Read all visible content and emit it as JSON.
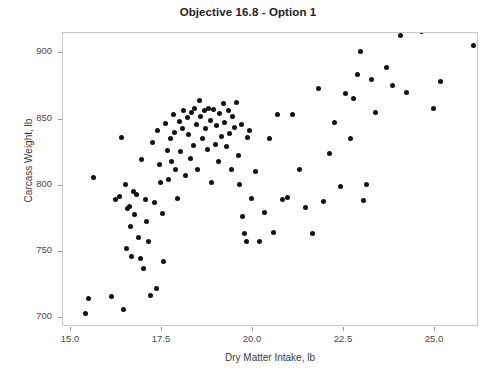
{
  "chart_data": {
    "type": "scatter",
    "title": "Objective 16.8 - Option 1",
    "xlabel": "Dry Matter Intake, lb",
    "ylabel": "Carcass Weight, lb",
    "xlim": [
      14.78,
      26.21
    ],
    "ylim": [
      693.0,
      915.5
    ],
    "xticks": [
      15.0,
      17.5,
      20.0,
      22.5,
      25.0
    ],
    "xticklabels": [
      "15.0",
      "17.5",
      "20.0",
      "22.5",
      "25.0"
    ],
    "yticks": [
      700,
      750,
      800,
      850,
      900
    ],
    "yticklabels": [
      "700",
      "750",
      "800",
      "850",
      "900"
    ],
    "grid": false,
    "legend": null,
    "marker": "filled-circle",
    "marker_color": "#121212",
    "marker_size_px": 5,
    "n_points": 122,
    "series": [
      {
        "name": "observations",
        "points": [
          [
            15.41,
            703.5
          ],
          [
            15.49,
            714.5
          ],
          [
            15.61,
            806.5
          ],
          [
            16.12,
            716.0
          ],
          [
            16.21,
            789.5
          ],
          [
            16.32,
            791.5
          ],
          [
            16.38,
            836.5
          ],
          [
            16.44,
            706.5
          ],
          [
            16.49,
            800.5
          ],
          [
            16.52,
            752.5
          ],
          [
            16.55,
            782.5
          ],
          [
            16.6,
            784.0
          ],
          [
            16.63,
            769.0
          ],
          [
            16.66,
            746.5
          ],
          [
            16.71,
            795.5
          ],
          [
            16.74,
            778.0
          ],
          [
            16.79,
            793.0
          ],
          [
            16.85,
            760.5
          ],
          [
            16.91,
            744.5
          ],
          [
            16.94,
            819.5
          ],
          [
            17.0,
            737.5
          ],
          [
            17.05,
            789.5
          ],
          [
            17.08,
            772.5
          ],
          [
            17.13,
            757.5
          ],
          [
            17.19,
            716.5
          ],
          [
            17.25,
            832.5
          ],
          [
            17.3,
            787.0
          ],
          [
            17.34,
            722.0
          ],
          [
            17.38,
            841.5
          ],
          [
            17.42,
            816.0
          ],
          [
            17.47,
            802.0
          ],
          [
            17.52,
            779.0
          ],
          [
            17.55,
            742.5
          ],
          [
            17.6,
            847.0
          ],
          [
            17.64,
            826.5
          ],
          [
            17.68,
            804.5
          ],
          [
            17.72,
            836.0
          ],
          [
            17.77,
            818.5
          ],
          [
            17.81,
            853.5
          ],
          [
            17.85,
            840.0
          ],
          [
            17.88,
            812.5
          ],
          [
            17.92,
            790.5
          ],
          [
            17.97,
            848.5
          ],
          [
            18.02,
            826.0
          ],
          [
            18.06,
            843.0
          ],
          [
            18.1,
            857.0
          ],
          [
            18.14,
            807.5
          ],
          [
            18.19,
            851.5
          ],
          [
            18.23,
            838.5
          ],
          [
            18.27,
            820.5
          ],
          [
            18.31,
            855.5
          ],
          [
            18.36,
            830.5
          ],
          [
            18.4,
            858.5
          ],
          [
            18.44,
            846.5
          ],
          [
            18.48,
            812.0
          ],
          [
            18.53,
            864.5
          ],
          [
            18.57,
            852.0
          ],
          [
            18.61,
            836.0
          ],
          [
            18.66,
            856.5
          ],
          [
            18.7,
            843.5
          ],
          [
            18.74,
            827.5
          ],
          [
            18.79,
            858.0
          ],
          [
            18.83,
            849.0
          ],
          [
            18.87,
            802.0
          ],
          [
            18.92,
            857.5
          ],
          [
            18.96,
            831.0
          ],
          [
            19.0,
            845.5
          ],
          [
            19.05,
            818.5
          ],
          [
            19.09,
            854.5
          ],
          [
            19.14,
            837.0
          ],
          [
            19.18,
            862.0
          ],
          [
            19.23,
            848.0
          ],
          [
            19.27,
            829.5
          ],
          [
            19.32,
            857.0
          ],
          [
            19.36,
            839.5
          ],
          [
            19.41,
            812.5
          ],
          [
            19.45,
            852.5
          ],
          [
            19.5,
            844.0
          ],
          [
            19.54,
            863.0
          ],
          [
            19.59,
            823.0
          ],
          [
            19.63,
            800.5
          ],
          [
            19.68,
            846.5
          ],
          [
            19.72,
            777.0
          ],
          [
            19.77,
            764.0
          ],
          [
            19.81,
            757.5
          ],
          [
            19.86,
            836.5
          ],
          [
            19.9,
            841.5
          ],
          [
            19.95,
            790.0
          ],
          [
            20.08,
            810.5
          ],
          [
            20.18,
            757.5
          ],
          [
            20.32,
            780.0
          ],
          [
            20.46,
            836.0
          ],
          [
            20.55,
            764.5
          ],
          [
            20.68,
            854.0
          ],
          [
            20.82,
            789.5
          ],
          [
            20.95,
            791.0
          ],
          [
            21.09,
            853.5
          ],
          [
            21.27,
            812.0
          ],
          [
            21.45,
            783.5
          ],
          [
            21.63,
            763.5
          ],
          [
            21.81,
            873.5
          ],
          [
            21.95,
            788.0
          ],
          [
            22.09,
            824.5
          ],
          [
            22.23,
            847.5
          ],
          [
            22.41,
            799.5
          ],
          [
            22.55,
            869.5
          ],
          [
            22.68,
            835.5
          ],
          [
            22.77,
            866.0
          ],
          [
            22.86,
            884.0
          ],
          [
            22.95,
            901.5
          ],
          [
            23.04,
            788.5
          ],
          [
            23.13,
            801.0
          ],
          [
            23.27,
            880.5
          ],
          [
            23.36,
            855.5
          ],
          [
            23.68,
            889.5
          ],
          [
            23.82,
            875.5
          ],
          [
            24.05,
            913.5
          ],
          [
            24.23,
            870.5
          ],
          [
            24.64,
            916.5
          ],
          [
            24.95,
            858.5
          ],
          [
            25.14,
            879.0
          ],
          [
            26.05,
            906.0
          ]
        ]
      }
    ]
  }
}
